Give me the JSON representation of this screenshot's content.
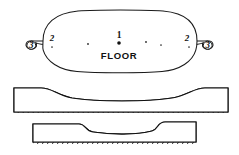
{
  "figure": {
    "kind": "patent-drawing",
    "background_color": "#ffffff",
    "line_color": "#1a1a1a",
    "hatch_color": "#1c1c1c"
  },
  "plan_view": {
    "name": "plan-view",
    "center_label": "1",
    "floor_label": "FLOOR",
    "left_handle": {
      "loop_label": "3",
      "body_label": "2"
    },
    "right_handle": {
      "loop_label": "3",
      "body_label": "2"
    },
    "floor_dots": [
      {
        "cx": 52,
        "cy": 47,
        "r": 0.85
      },
      {
        "cx": 88,
        "cy": 44,
        "r": 0.9
      },
      {
        "cx": 119,
        "cy": 43,
        "r": 1.8
      },
      {
        "cx": 146,
        "cy": 42,
        "r": 0.9
      },
      {
        "cx": 161,
        "cy": 45,
        "r": 0.85
      },
      {
        "cx": 189,
        "cy": 47,
        "r": 0.85
      }
    ]
  },
  "section_upper": {
    "name": "upper-cross-section",
    "description": "Long cross-section with thick raised ends and thin dished middle",
    "hatch_count": 46,
    "hatch_angle_deg": 60
  },
  "section_lower": {
    "name": "lower-cross-section",
    "description": "Shorter cross-section with thick raised ends and thin recessed middle on a flat base",
    "hatch_count": 34,
    "hatch_angle_deg": 60
  }
}
